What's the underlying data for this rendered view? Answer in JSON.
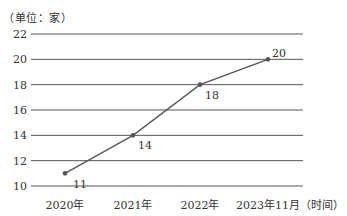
{
  "chart_data": {
    "type": "line",
    "title": "",
    "ylabel": "（单位：家）",
    "xlabel": "（时间）",
    "categories": [
      "2020年",
      "2021年",
      "2022年",
      "2023年11月"
    ],
    "values": [
      11,
      14,
      18,
      20
    ],
    "data_labels": [
      "11",
      "14",
      "18",
      "20"
    ],
    "ylim": [
      10,
      22
    ],
    "yticks": [
      10,
      12,
      14,
      16,
      18,
      20,
      22
    ],
    "grid": true,
    "legend": null,
    "line_color": "#555555",
    "grid_color": "#555555"
  }
}
